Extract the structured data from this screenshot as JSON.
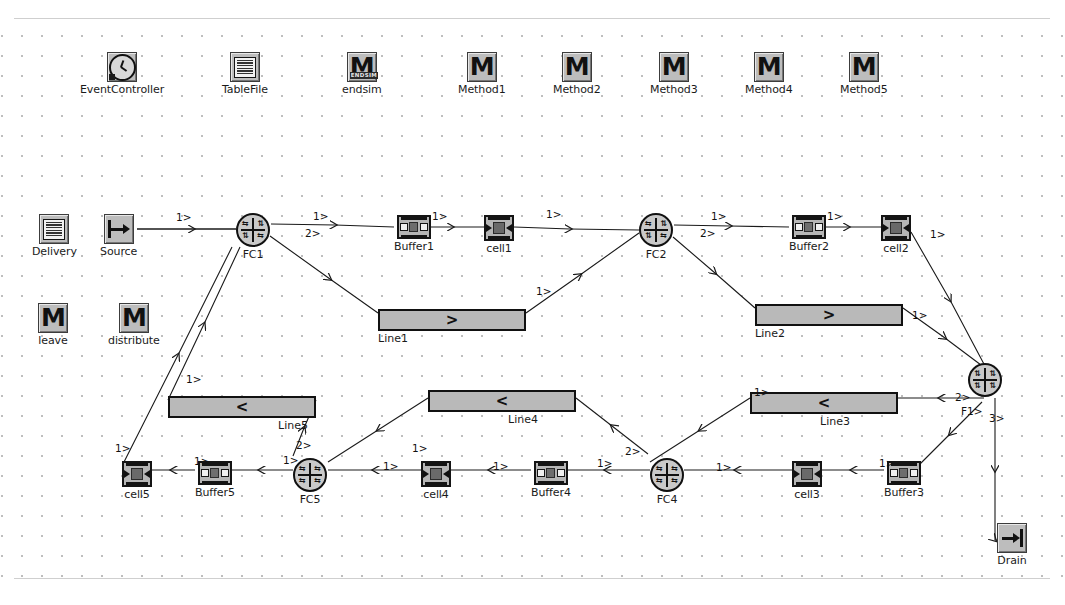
{
  "canvas": {
    "grid": "dotted",
    "background_color": "#ffffff",
    "grid_dot_color": "#9a9a9a"
  },
  "library_icons": [
    {
      "name": "EventController",
      "label": "EventController",
      "icon": "clock-icon",
      "x": 80,
      "y": 52
    },
    {
      "name": "TableFile",
      "label": "TableFile",
      "icon": "table-icon",
      "x": 222,
      "y": 52
    },
    {
      "name": "endsim",
      "label": "endsim",
      "icon": "method-endsim-icon",
      "x": 342,
      "y": 52
    },
    {
      "name": "Method1",
      "label": "Method1",
      "icon": "method-icon",
      "x": 458,
      "y": 52
    },
    {
      "name": "Method2",
      "label": "Method2",
      "icon": "method-icon",
      "x": 553,
      "y": 52
    },
    {
      "name": "Method3",
      "label": "Method3",
      "icon": "method-icon",
      "x": 650,
      "y": 52
    },
    {
      "name": "Method4",
      "label": "Method4",
      "icon": "method-icon",
      "x": 745,
      "y": 52
    },
    {
      "name": "Method5",
      "label": "Method5",
      "icon": "method-icon",
      "x": 840,
      "y": 52
    }
  ],
  "side_icons": [
    {
      "name": "Delivery",
      "label": "Delivery",
      "icon": "table-icon",
      "x": 32,
      "y": 214
    },
    {
      "name": "Source",
      "label": "Source",
      "icon": "source-icon",
      "x": 100,
      "y": 214
    },
    {
      "name": "leave",
      "label": "leave",
      "icon": "method-icon",
      "x": 38,
      "y": 303
    },
    {
      "name": "distribute",
      "label": "distribute",
      "icon": "method-icon",
      "x": 108,
      "y": 303
    }
  ],
  "flow_controls": [
    {
      "name": "FC1",
      "label": "FC1",
      "x": 236,
      "y": 213
    },
    {
      "name": "FC2",
      "label": "FC2",
      "x": 639,
      "y": 213
    },
    {
      "name": "F1",
      "label": "F1",
      "x": 985,
      "y": 363
    },
    {
      "name": "FC4",
      "label": "FC4",
      "x": 650,
      "y": 458
    },
    {
      "name": "FC5",
      "label": "FC5",
      "x": 293,
      "y": 458
    }
  ],
  "buffers": [
    {
      "name": "Buffer1",
      "label": "Buffer1",
      "x": 394,
      "y": 215
    },
    {
      "name": "Buffer2",
      "label": "Buffer2",
      "x": 789,
      "y": 215
    },
    {
      "name": "Buffer3",
      "label": "Buffer3",
      "x": 884,
      "y": 461
    },
    {
      "name": "Buffer4",
      "label": "Buffer4",
      "x": 531,
      "y": 461
    },
    {
      "name": "Buffer5",
      "label": "Buffer5",
      "x": 195,
      "y": 461
    }
  ],
  "cells": [
    {
      "name": "cell1",
      "label": "cell1",
      "x": 484,
      "y": 215
    },
    {
      "name": "cell2",
      "label": "cell2",
      "x": 881,
      "y": 215
    },
    {
      "name": "cell3",
      "label": "cell3",
      "x": 792,
      "y": 461
    },
    {
      "name": "cell4",
      "label": "cell4",
      "x": 421,
      "y": 461
    },
    {
      "name": "cell5",
      "label": "cell5",
      "x": 122,
      "y": 461
    }
  ],
  "lines": [
    {
      "name": "Line1",
      "label": "Line1",
      "direction": ">",
      "x": 378,
      "y": 309,
      "w": 148,
      "h": 22,
      "lx": 378,
      "ly": 333
    },
    {
      "name": "Line2",
      "label": "Line2",
      "direction": ">",
      "x": 755,
      "y": 304,
      "w": 148,
      "h": 22,
      "lx": 755,
      "ly": 328
    },
    {
      "name": "Line3",
      "label": "Line3",
      "direction": "<",
      "x": 750,
      "y": 392,
      "w": 148,
      "h": 22,
      "lx": 820,
      "ly": 416
    },
    {
      "name": "Line4",
      "label": "Line4",
      "direction": "<",
      "x": 428,
      "y": 390,
      "w": 148,
      "h": 22,
      "lx": 508,
      "ly": 414
    },
    {
      "name": "Line5",
      "label": "Line5",
      "direction": "<",
      "x": 168,
      "y": 396,
      "w": 148,
      "h": 22,
      "lx": 278,
      "ly": 420
    }
  ],
  "drain": {
    "name": "Drain",
    "label": "Drain",
    "x": 997,
    "y": 523
  },
  "port_labels": [
    {
      "text": "1>",
      "x": 176,
      "y": 212
    },
    {
      "text": "1>",
      "x": 313,
      "y": 211
    },
    {
      "text": "2>",
      "x": 305,
      "y": 228
    },
    {
      "text": "1>",
      "x": 432,
      "y": 211
    },
    {
      "text": "1>",
      "x": 546,
      "y": 209
    },
    {
      "text": "1>",
      "x": 536,
      "y": 286
    },
    {
      "text": "1>",
      "x": 711,
      "y": 211
    },
    {
      "text": "2>",
      "x": 700,
      "y": 228
    },
    {
      "text": "1>",
      "x": 827,
      "y": 211
    },
    {
      "text": "1>",
      "x": 930,
      "y": 229
    },
    {
      "text": "1>",
      "x": 912,
      "y": 310
    },
    {
      "text": "2>",
      "x": 955,
      "y": 392
    },
    {
      "text": "F1>",
      "x": 961,
      "y": 406
    },
    {
      "text": "3>",
      "x": 989,
      "y": 413
    },
    {
      "text": "1>",
      "x": 716,
      "y": 462
    },
    {
      "text": "1>",
      "x": 879,
      "y": 458
    },
    {
      "text": "1>",
      "x": 754,
      "y": 387
    },
    {
      "text": "2>",
      "x": 625,
      "y": 446
    },
    {
      "text": "1>",
      "x": 597,
      "y": 458
    },
    {
      "text": "1>",
      "x": 493,
      "y": 461
    },
    {
      "text": "1>",
      "x": 412,
      "y": 443
    },
    {
      "text": "1>",
      "x": 383,
      "y": 461
    },
    {
      "text": "2>",
      "x": 296,
      "y": 440
    },
    {
      "text": "1>",
      "x": 283,
      "y": 455
    },
    {
      "text": "1>",
      "x": 194,
      "y": 456
    },
    {
      "text": "1>",
      "x": 115,
      "y": 443
    },
    {
      "text": "1>",
      "x": 186,
      "y": 374
    }
  ],
  "wires": [
    {
      "from": "Source",
      "to": "FC1",
      "points": "137,229 236,229"
    },
    {
      "from": "FC1.1",
      "to": "Buffer1",
      "points": "271,224 394,227"
    },
    {
      "from": "Buffer1",
      "to": "cell1",
      "points": "428,227 484,227"
    },
    {
      "from": "cell1",
      "to": "FC2",
      "points": "514,227 639,230"
    },
    {
      "from": "FC1.2",
      "to": "Line1",
      "points": "270,236 378,313"
    },
    {
      "from": "Line1",
      "to": "FC2",
      "points": "526,313 639,233"
    },
    {
      "from": "FC2.1",
      "to": "Buffer2",
      "points": "674,225 789,227"
    },
    {
      "from": "Buffer2",
      "to": "cell2",
      "points": "823,227 881,227"
    },
    {
      "from": "cell2",
      "to": "F1",
      "points": "911,232 985,366"
    },
    {
      "from": "FC2.2",
      "to": "Line2",
      "points": "673,237 755,308"
    },
    {
      "from": "Line2",
      "to": "F1",
      "points": "903,308 985,368"
    },
    {
      "from": "F1.2",
      "to": "Line3",
      "points": "984,398 898,398"
    },
    {
      "from": "Line3",
      "to": "FC4",
      "points": "750,398 650,462"
    },
    {
      "from": "F1.F1",
      "to": "Buffer3",
      "points": "982,402 918,466"
    },
    {
      "from": "Buffer3",
      "to": "cell3",
      "points": "884,470 822,470"
    },
    {
      "from": "cell3",
      "to": "FC4",
      "points": "792,470 684,470"
    },
    {
      "from": "FC4.2",
      "to": "Line4",
      "points": "648,454 576,398"
    },
    {
      "from": "Line4",
      "to": "FC5",
      "points": "428,398 328,462"
    },
    {
      "from": "FC4.1",
      "to": "Buffer4",
      "points": "650,470 565,470"
    },
    {
      "from": "Buffer4",
      "to": "cell4",
      "points": "531,470 451,470"
    },
    {
      "from": "cell4",
      "to": "FC5",
      "points": "421,470 328,470"
    },
    {
      "from": "FC5.2",
      "to": "Line5",
      "points": "293,456 316,400"
    },
    {
      "from": "Line5",
      "to": "FC1",
      "points": "168,400 240,247"
    },
    {
      "from": "FC5.1",
      "to": "Buffer5",
      "points": "293,470 229,470"
    },
    {
      "from": "Buffer5",
      "to": "cell5",
      "points": "195,470 152,470"
    },
    {
      "from": "cell5",
      "to": "FC1",
      "points": "124,462 232,247"
    },
    {
      "from": "F1.3",
      "to": "Drain",
      "points": "995,398 995,540 1003,540"
    }
  ]
}
